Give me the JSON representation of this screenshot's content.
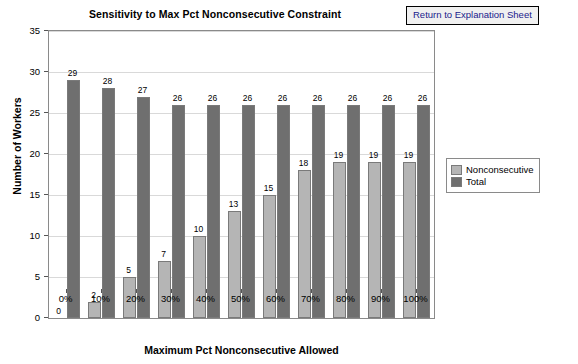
{
  "header": {
    "return_button_label": "Return to Explanation Sheet"
  },
  "legend": {
    "items": [
      {
        "label": "Nonconsecutive",
        "color": "#b5b5b5"
      },
      {
        "label": "Total",
        "color": "#6f6f6f"
      }
    ]
  },
  "chart_data": {
    "type": "bar",
    "title": "Sensitivity to Max Pct Nonconsecutive Constraint",
    "xlabel": "Maximum Pct Nonconsecutive Allowed",
    "ylabel": "Number of Workers",
    "categories": [
      "0%",
      "10%",
      "20%",
      "30%",
      "40%",
      "50%",
      "60%",
      "70%",
      "80%",
      "90%",
      "100%"
    ],
    "series": [
      {
        "name": "Nonconsecutive",
        "values": [
          0,
          2,
          5,
          7,
          10,
          13,
          15,
          18,
          19,
          19,
          19
        ]
      },
      {
        "name": "Total",
        "values": [
          29,
          28,
          27,
          26,
          26,
          26,
          26,
          26,
          26,
          26,
          26
        ]
      }
    ],
    "ylim": [
      0,
      35
    ],
    "yticks": [
      0,
      5,
      10,
      15,
      20,
      25,
      30,
      35
    ],
    "grid": true,
    "legend_position": "right"
  }
}
